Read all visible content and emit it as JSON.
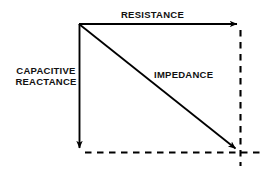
{
  "diagram": {
    "type": "vector-triangle",
    "background_color": "#ffffff",
    "stroke_color": "#000000",
    "labels": {
      "resistance": "RESISTANCE",
      "capacitive_reactance_line1": "CAPACITIVE",
      "capacitive_reactance_line2": "REACTANCE",
      "impedance": "IMPEDANCE"
    },
    "vectors": [
      {
        "name": "resistance",
        "label": "RESISTANCE",
        "style": "solid",
        "arrowhead": "end",
        "from": [
          79,
          24
        ],
        "to": [
          242,
          24
        ]
      },
      {
        "name": "capacitive-reactance",
        "label": "CAPACITIVE REACTANCE",
        "style": "solid",
        "arrowhead": "end",
        "from": [
          79,
          24
        ],
        "to": [
          79,
          153
        ]
      },
      {
        "name": "impedance",
        "label": "IMPEDANCE",
        "style": "solid",
        "arrowhead": "end",
        "from": [
          79,
          24
        ],
        "to": [
          240,
          152
        ]
      }
    ],
    "construction_lines": [
      {
        "name": "bottom-dashed-guide",
        "style": "dashed",
        "from": [
          85,
          152
        ],
        "to": [
          264,
          152
        ]
      },
      {
        "name": "right-dashed-guide",
        "style": "dashed",
        "from": [
          240,
          30
        ],
        "to": [
          240,
          166
        ]
      }
    ]
  }
}
